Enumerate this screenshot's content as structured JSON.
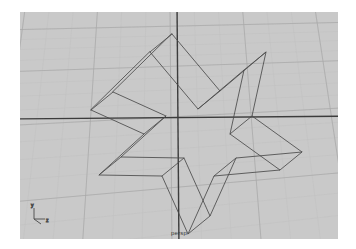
{
  "app": {
    "name": "3D CAD Modeler",
    "window_background": "#ffffff"
  },
  "viewport": {
    "label": "persp",
    "projection": "perspective",
    "background_color": "#c9c9c9",
    "grid": {
      "visible": true,
      "minor_line_color": "#bfbfbf",
      "major_line_color": "#a9a9a9",
      "minor_spacing_px": 9,
      "major_every": 5
    },
    "axes": {
      "x_axis_color": "#3c3c3c",
      "y_axis_color": "#3c3c3c",
      "origin_x_px": 158,
      "origin_y_px": 106
    },
    "axis_gizmo": {
      "x_label": "x",
      "y_label": "y",
      "z_label": "z",
      "color": "#4a4a4a",
      "position_x_px": 13,
      "position_y_px": 196
    }
  },
  "model": {
    "name": "extruded-star",
    "object_type": "polysurface",
    "display_mode": "wireframe",
    "wire_color": "#4a4a4a",
    "wire_width": 0.8,
    "points": 5,
    "top_outline": [
      [
        152,
        22
      ],
      [
        200,
        79
      ],
      [
        246,
        40
      ],
      [
        232,
        104
      ],
      [
        282,
        140
      ],
      [
        216,
        146
      ],
      [
        190,
        204
      ],
      [
        164,
        146
      ],
      [
        101,
        145
      ],
      [
        146,
        104
      ],
      [
        93,
        80
      ]
    ],
    "top_face_path": "M 152 22 L 200 79 L 246 40 L 232 104 L 282 140 L 216 146 L 190 204 L 164 146 L 101 145 L 146 104 L 93 80 Z",
    "bottom_offset_x_px": -22,
    "bottom_offset_y_px": 18
  }
}
